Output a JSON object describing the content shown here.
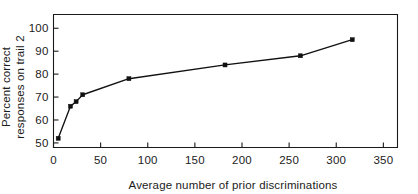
{
  "chart_data": {
    "type": "line",
    "title": "",
    "xlabel": "Average number of prior discriminations",
    "ylabel_line1": "Percent correct",
    "ylabel_line2": "responses on trail 2",
    "ylabel": "Percent correct responses on trail 2",
    "xlim": [
      0,
      365
    ],
    "ylim": [
      48,
      106
    ],
    "xticks": [
      0,
      50,
      100,
      150,
      200,
      250,
      300,
      350
    ],
    "xtick_labels": [
      "0",
      "50",
      "100",
      "150",
      "200",
      "250",
      "300",
      "350"
    ],
    "yticks": [
      50,
      60,
      70,
      80,
      90,
      100
    ],
    "ytick_labels": [
      "50",
      "60",
      "70",
      "80",
      "90",
      "100"
    ],
    "grid": false,
    "legend": null,
    "series": [
      {
        "name": "Percent correct responses on trial 2",
        "marker": "filled-square",
        "color": "#111111",
        "points": [
          {
            "x": 5,
            "y": 52
          },
          {
            "x": 18,
            "y": 66
          },
          {
            "x": 24,
            "y": 68
          },
          {
            "x": 31,
            "y": 71
          },
          {
            "x": 80,
            "y": 78
          },
          {
            "x": 182,
            "y": 84
          },
          {
            "x": 262,
            "y": 88
          },
          {
            "x": 317,
            "y": 95
          }
        ]
      }
    ]
  },
  "figure": {
    "background_color": "#ffffff",
    "ink_color": "#111111"
  }
}
